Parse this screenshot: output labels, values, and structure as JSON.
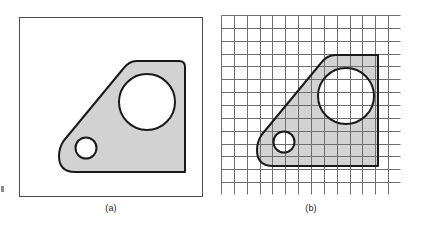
{
  "figure": {
    "background_color": "#ffffff",
    "panels": [
      {
        "id": "a",
        "caption": "(a)",
        "kind": "continuous-part-outline",
        "frame": {
          "stroke": "#4d4d4d",
          "fill": "#ffffff",
          "stroke_width": 1
        },
        "grid": {
          "visible": false,
          "rows": 0,
          "cols": 0
        }
      },
      {
        "id": "b",
        "caption": "(b)",
        "kind": "part-outline-on-raster-grid",
        "frame": {
          "stroke": "#4d4d4d",
          "fill": "#ffffff",
          "stroke_width": 1
        },
        "grid": {
          "visible": true,
          "rows": 14,
          "cols": 14,
          "line_color": "#6e6e6e",
          "line_width": 1
        }
      }
    ],
    "part": {
      "name": "bracket-profile",
      "fill_color": "#d2d2d2",
      "outline_color": "#1a1a1a",
      "outline_width": 2,
      "holes": [
        {
          "name": "large-hole",
          "fill": "#ffffff",
          "radius_ratio": 0.155
        },
        {
          "name": "small-hole",
          "fill": "#ffffff",
          "radius_ratio": 0.058
        }
      ]
    },
    "edge_artifact": {
      "visible": true,
      "color": "#8c8c8c"
    }
  }
}
